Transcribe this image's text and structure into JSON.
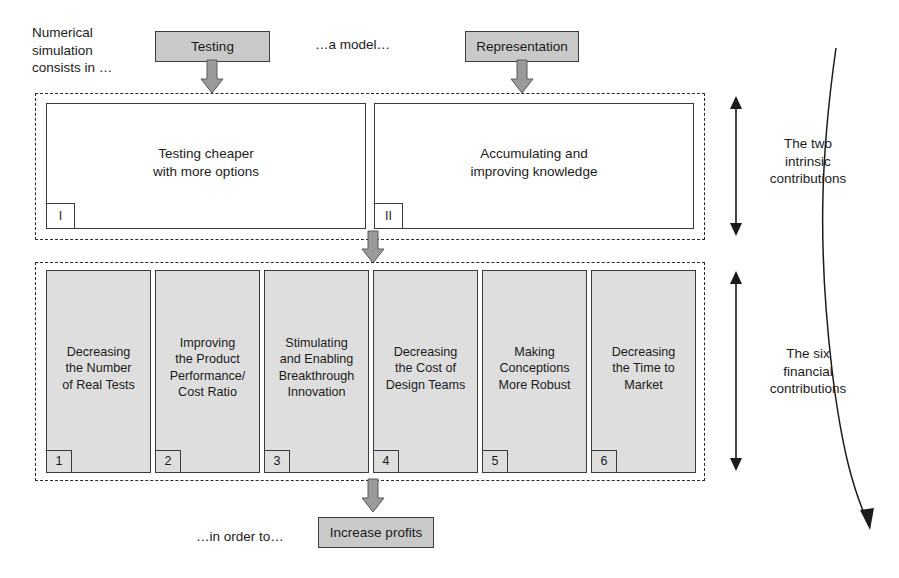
{
  "diagram": {
    "title_note_left": "Numerical\nsimulation\nconsists in …",
    "model_note": "…a model…",
    "in_order_to_note": "…in order to…",
    "chips": {
      "testing": "Testing",
      "representation": "Representation",
      "increase_profits": "Increase profits"
    },
    "intrinsic": {
      "side_label": "The two\nintrinsic\ncontributions",
      "boxes": [
        {
          "num": "I",
          "label": "Testing cheaper\nwith more options"
        },
        {
          "num": "II",
          "label": "Accumulating and\nimproving knowledge"
        }
      ]
    },
    "financial": {
      "side_label": "The six\nfinancial\ncontributions",
      "boxes": [
        {
          "num": "1",
          "label": "Decreasing\nthe Number\nof Real Tests"
        },
        {
          "num": "2",
          "label": "Improving\nthe Product\nPerformance/\nCost Ratio"
        },
        {
          "num": "3",
          "label": "Stimulating\nand Enabling\nBreakthrough\nInnovation"
        },
        {
          "num": "4",
          "label": "Decreasing\nthe Cost of\nDesign Teams"
        },
        {
          "num": "5",
          "label": "Making\nConceptions\nMore Robust"
        },
        {
          "num": "6",
          "label": "Decreasing\nthe Time to\nMarket"
        }
      ]
    },
    "colors": {
      "chip_fill": "#c9c9c9",
      "box_grey_fill": "#dedede",
      "stroke": "#3a3a3a",
      "arrow_fill": "#9a9a9a",
      "text": "#1b1b1b"
    }
  }
}
